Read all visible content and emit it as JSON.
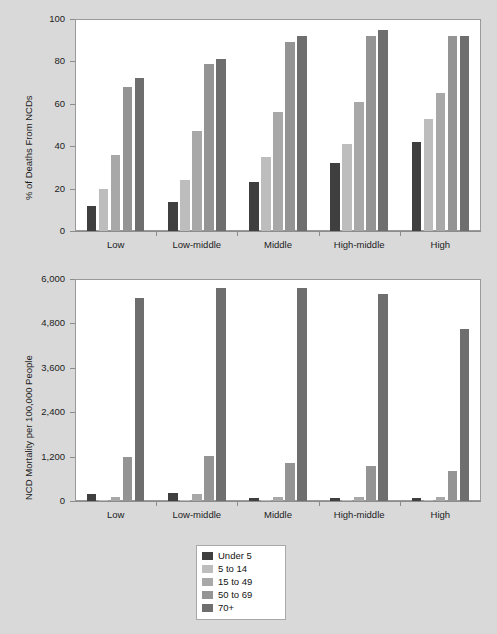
{
  "figure": {
    "background_color": "#d9d9d9",
    "plot_background_color": "#ffffff"
  },
  "legend": {
    "position": "bottom-center",
    "entries": [
      {
        "label": "Under 5",
        "color": "#3f3f3f"
      },
      {
        "label": "5 to 14",
        "color": "#bdbdbd"
      },
      {
        "label": "15 to 49",
        "color": "#a8a8a8"
      },
      {
        "label": "50 to 69",
        "color": "#949494"
      },
      {
        "label": "70+",
        "color": "#6e6e6e"
      }
    ]
  },
  "chart_data": [
    {
      "type": "bar",
      "title": "",
      "xlabel": "",
      "ylabel": "% of Deaths From NCDs",
      "ylim": [
        0,
        100
      ],
      "yticks": [
        0,
        20,
        40,
        60,
        80,
        100
      ],
      "ytick_labels": [
        "0",
        "20",
        "40",
        "60",
        "80",
        "100"
      ],
      "grid": true,
      "categories": [
        "Low",
        "Low-middle",
        "Middle",
        "High-middle",
        "High"
      ],
      "series": [
        {
          "name": "Under 5",
          "color": "#3f3f3f",
          "values": [
            12,
            13.5,
            23,
            32,
            42
          ]
        },
        {
          "name": "5 to 14",
          "color": "#bdbdbd",
          "values": [
            20,
            24,
            35,
            41,
            53
          ]
        },
        {
          "name": "15 to 49",
          "color": "#a8a8a8",
          "values": [
            36,
            47,
            56,
            61,
            65
          ]
        },
        {
          "name": "50 to 69",
          "color": "#949494",
          "values": [
            68,
            79,
            89,
            92,
            92
          ]
        },
        {
          "name": "70+",
          "color": "#6e6e6e",
          "values": [
            72,
            81,
            92,
            95,
            92
          ]
        }
      ]
    },
    {
      "type": "bar",
      "title": "",
      "xlabel": "",
      "ylabel": "NCD Mortality per 100,000 People",
      "ylim": [
        0,
        6000
      ],
      "yticks": [
        0,
        1200,
        2400,
        3600,
        4800,
        6000
      ],
      "ytick_labels": [
        "0",
        "1,200",
        "2,400",
        "3,600",
        "4,800",
        "6,000"
      ],
      "grid": true,
      "categories": [
        "Low",
        "Low-middle",
        "Middle",
        "High-middle",
        "High"
      ],
      "series": [
        {
          "name": "Under 5",
          "color": "#3f3f3f",
          "values": [
            180,
            210,
            80,
            90,
            80
          ]
        },
        {
          "name": "5 to 14",
          "color": "#bdbdbd",
          "values": [
            30,
            20,
            25,
            30,
            20
          ]
        },
        {
          "name": "15 to 49",
          "color": "#a8a8a8",
          "values": [
            110,
            200,
            110,
            105,
            100
          ]
        },
        {
          "name": "50 to 69",
          "color": "#949494",
          "values": [
            1190,
            1210,
            1020,
            950,
            810
          ]
        },
        {
          "name": "70+",
          "color": "#6e6e6e",
          "values": [
            5500,
            5750,
            5750,
            5600,
            4650
          ]
        }
      ]
    }
  ]
}
